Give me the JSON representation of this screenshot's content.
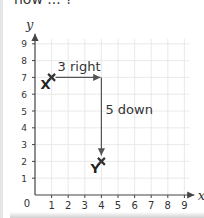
{
  "header": {
    "text": "now ... ?"
  },
  "diagram": {
    "axes": {
      "x_label": "x",
      "y_label": "y",
      "x_ticks": [
        "1",
        "2",
        "3",
        "4",
        "5",
        "6",
        "7",
        "8",
        "9"
      ],
      "y_ticks": [
        "1",
        "2",
        "3",
        "4",
        "5",
        "6",
        "7",
        "8",
        "9"
      ],
      "origin_label": "0"
    },
    "points": [
      {
        "label": "X",
        "x": 1,
        "y": 7
      },
      {
        "label": "Y",
        "x": 4,
        "y": 2
      }
    ],
    "moves": [
      {
        "label": "3 right",
        "direction": "right",
        "amount": 3
      },
      {
        "label": "5 down",
        "direction": "down",
        "amount": 5
      }
    ],
    "colors": {
      "grid": "#e4e4e4",
      "axis": "#444444",
      "arrow": "#555555",
      "marker": "#333333"
    }
  }
}
